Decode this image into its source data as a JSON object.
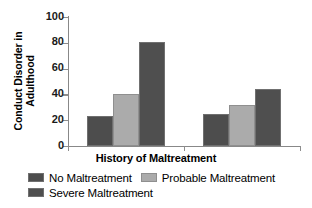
{
  "chart_data": {
    "type": "bar",
    "title": "",
    "xlabel": "History of Maltreatment",
    "ylabel_lines": [
      "Conduct Disorder in",
      "Adulthood"
    ],
    "ylabel": "Conduct Disorder in Adulthood",
    "categories": [
      "Group 1",
      "Group 2"
    ],
    "ylim": [
      0,
      100
    ],
    "yticks": [
      0,
      20,
      40,
      60,
      80,
      100
    ],
    "ytick_labels": [
      "0",
      "20",
      "40",
      "60",
      "80",
      "100"
    ],
    "grid": false,
    "legend_position": "bottom",
    "series": [
      {
        "name": "No Maltreatment",
        "color": "#4d4d4d",
        "values": [
          23,
          25
        ]
      },
      {
        "name": "Probable Maltreatment",
        "color": "#ababab",
        "values": [
          40,
          32
        ]
      },
      {
        "name": "Severe Maltreatment",
        "color": "#4f4f4f",
        "values": [
          81,
          44
        ]
      }
    ]
  },
  "legend": {
    "items": [
      {
        "label": "No Maltreatment"
      },
      {
        "label": "Probable Maltreatment"
      },
      {
        "label": "Severe Maltreatment"
      }
    ]
  }
}
